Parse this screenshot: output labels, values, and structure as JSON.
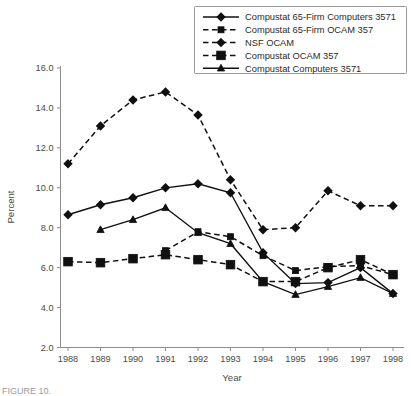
{
  "figure": {
    "caption_partial": "FIGURE 10.",
    "background": "#ffffff"
  },
  "chart_data": {
    "type": "line",
    "title": "",
    "xlabel": "Year",
    "ylabel": "Percent",
    "x": [
      1988,
      1989,
      1990,
      1991,
      1992,
      1993,
      1994,
      1995,
      1996,
      1997,
      1998
    ],
    "categories": [
      "1988",
      "1989",
      "1990",
      "1991",
      "1992",
      "1993",
      "1994",
      "1995",
      "1996",
      "1997",
      "1998"
    ],
    "xlim": [
      1988,
      1998
    ],
    "ylim": [
      2.0,
      16.0
    ],
    "yticks": [
      "2.0",
      "4.0",
      "6.0",
      "8.0",
      "10.0",
      "12.0",
      "14.0",
      "16.0"
    ],
    "ytick_values": [
      2.0,
      4.0,
      6.0,
      8.0,
      10.0,
      12.0,
      14.0,
      16.0
    ],
    "grid": false,
    "legend_position": "top-right",
    "series": [
      {
        "name": "Compustat 65-Firm Computers 3571",
        "marker": "diamond",
        "line_style": "solid",
        "color": "#101010",
        "x": [
          1988,
          1989,
          1990,
          1991,
          1992,
          1993,
          1994,
          1995,
          1996,
          1997,
          1998
        ],
        "values": [
          8.65,
          9.15,
          9.5,
          10.0,
          10.2,
          9.75,
          6.75,
          5.2,
          5.25,
          6.0,
          4.7
        ]
      },
      {
        "name": "Compustat 65-Firm OCAM 357",
        "marker": "square",
        "line_style": "dashed",
        "color": "#101010",
        "x": [
          1991,
          1992,
          1993,
          1994,
          1995,
          1996,
          1997,
          1998
        ],
        "values": [
          6.85,
          7.8,
          7.55,
          6.6,
          5.85,
          6.05,
          6.1,
          5.65
        ]
      },
      {
        "name": "NSF OCAM",
        "marker": "diamond",
        "line_style": "dashed",
        "color": "#101010",
        "x": [
          1988,
          1989,
          1990,
          1991,
          1992,
          1993,
          1994,
          1995,
          1996,
          1997,
          1998
        ],
        "values": [
          11.2,
          13.1,
          14.4,
          14.8,
          13.65,
          10.4,
          7.9,
          8.0,
          9.85,
          9.1,
          9.1
        ]
      },
      {
        "name": "Compustat OCAM 357",
        "marker": "square-large",
        "line_style": "dashed",
        "color": "#101010",
        "x": [
          1988,
          1989,
          1990,
          1991,
          1992,
          1993,
          1994,
          1995,
          1996,
          1997,
          1998
        ],
        "values": [
          6.3,
          6.25,
          6.45,
          6.65,
          6.4,
          6.15,
          5.3,
          5.3,
          6.0,
          6.4,
          5.65
        ]
      },
      {
        "name": "Compustat Computers 3571",
        "marker": "triangle",
        "line_style": "solid",
        "color": "#101010",
        "x": [
          1989,
          1990,
          1991,
          1992,
          1993,
          1994,
          1995,
          1996,
          1997,
          1998
        ],
        "values": [
          7.9,
          8.4,
          9.0,
          7.75,
          7.2,
          5.3,
          4.65,
          5.05,
          5.5,
          4.7
        ]
      }
    ]
  },
  "legend": {
    "items": [
      {
        "label": "Compustat 65-Firm Computers 3571",
        "marker": "diamond",
        "line_style": "solid"
      },
      {
        "label": "Compustat 65-Firm OCAM 357",
        "marker": "square",
        "line_style": "dashed"
      },
      {
        "label": "NSF OCAM",
        "marker": "diamond",
        "line_style": "dashed"
      },
      {
        "label": "Compustat OCAM 357",
        "marker": "square-large",
        "line_style": "dashed"
      },
      {
        "label": "Compustat Computers 3571",
        "marker": "triangle",
        "line_style": "solid"
      }
    ]
  }
}
